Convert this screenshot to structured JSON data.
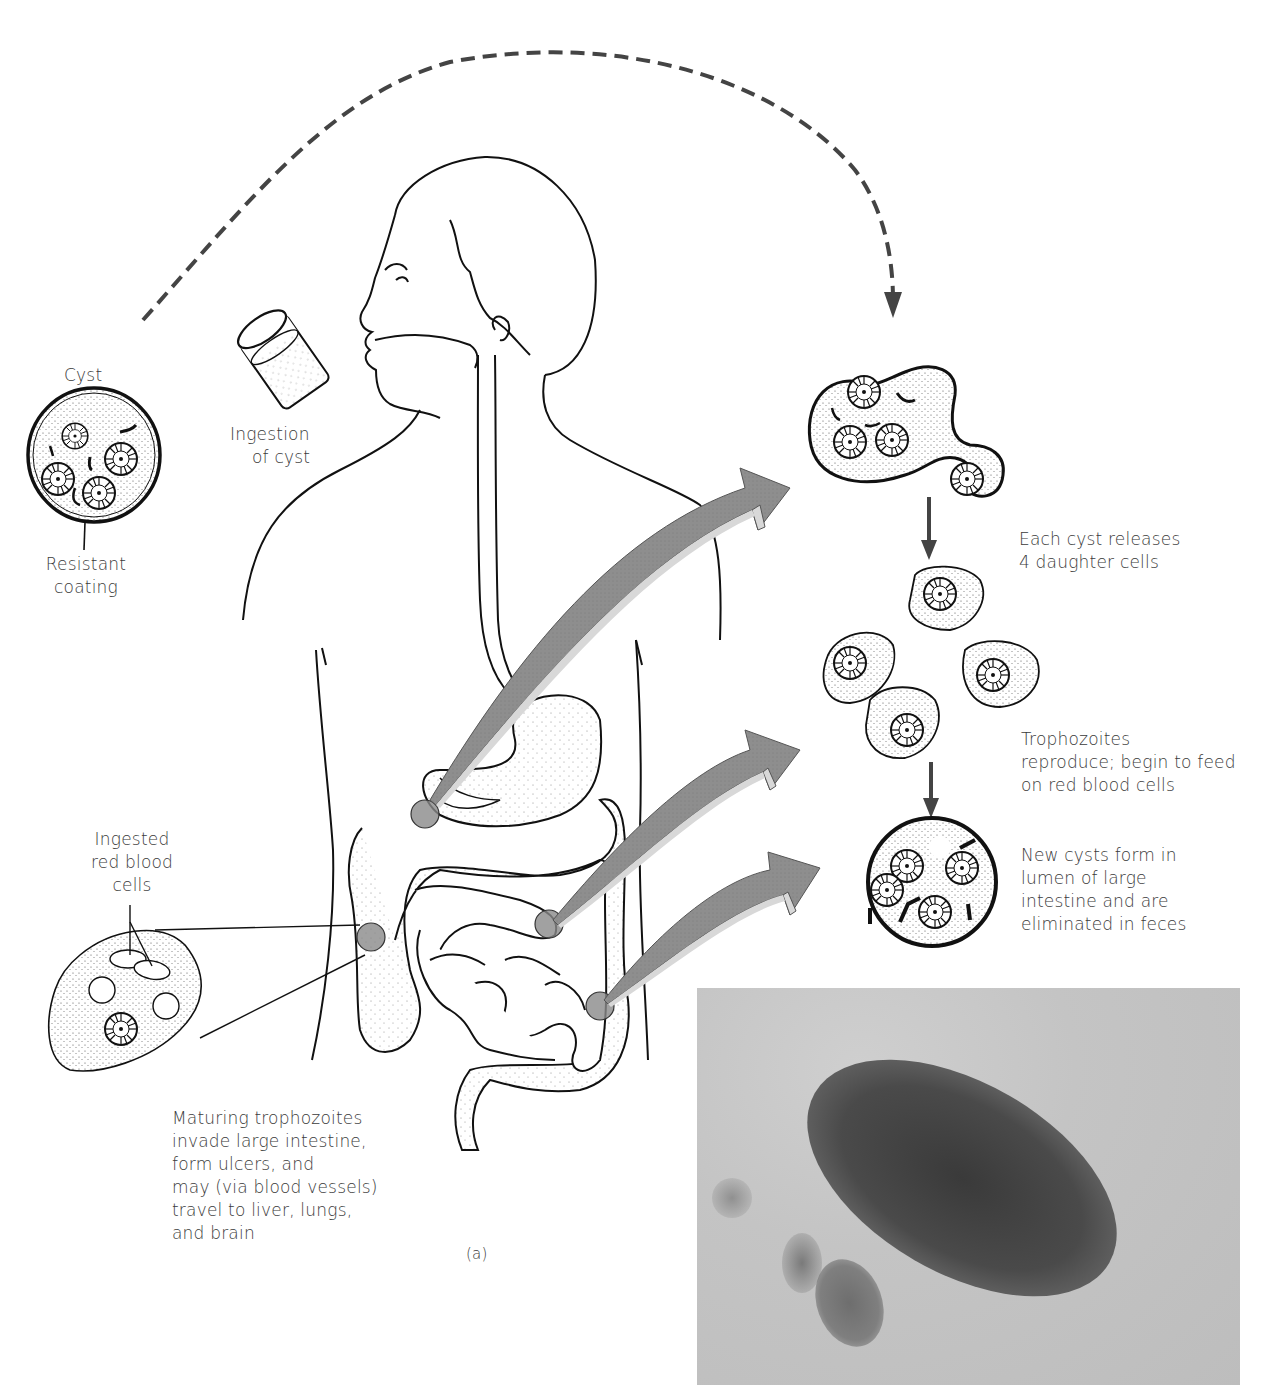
{
  "figure": {
    "panel_label": "(a)",
    "labels": {
      "cyst_title": "Cyst",
      "resistant_coating": [
        "Resistant",
        "coating"
      ],
      "ingestion": [
        "Ingestion",
        "of cyst"
      ],
      "cyst_releases": [
        "Each cyst releases",
        "4 daughter cells"
      ],
      "trophozoites_reproduce": [
        "Trophozoites",
        "reproduce; begin to feed",
        "on red blood cells"
      ],
      "new_cysts": [
        "New cysts form in",
        "lumen of large",
        "intestine and are",
        "eliminated in feces"
      ],
      "ingested_rbc": [
        "Ingested",
        "red blood",
        "cells"
      ],
      "maturing_trophozoites": [
        "Maturing trophozoites",
        "invade large intestine,",
        "form ulcers, and",
        "may (via blood vessels)",
        "travel to liver, lungs,",
        "and brain"
      ]
    },
    "photo": {
      "description": "micrograph of trophozoite"
    },
    "colors": {
      "line": "#1a1a1a",
      "dashed_arrow": "#444444",
      "big_arrow_fill": "#8f8f8f",
      "big_arrow_edge": "#d6d6d6",
      "infection_spot": "#8a8a8a",
      "text": "#3b3b3b"
    }
  }
}
